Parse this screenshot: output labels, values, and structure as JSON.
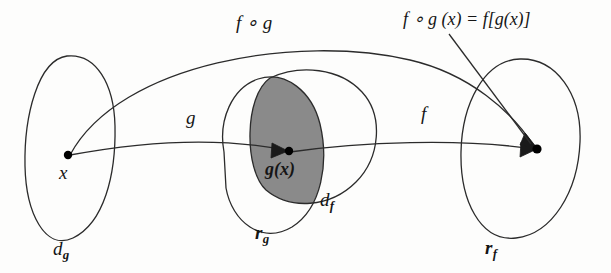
{
  "diagram": {
    "colors": {
      "background": "#fdfdfc",
      "stroke": "#2b2b2b",
      "shaded_region": "#8a8a8a",
      "point": "#000000",
      "text": "#151515"
    },
    "sets": [
      {
        "name": "domain-of-g",
        "label_main": "d",
        "label_sub": "g",
        "position": "left"
      },
      {
        "name": "range-of-g",
        "label_main": "r",
        "label_sub": "g",
        "position": "center-left"
      },
      {
        "name": "domain-of-f",
        "label_main": "d",
        "label_sub": "f",
        "position": "center-right"
      },
      {
        "name": "range-of-f",
        "label_main": "r",
        "label_sub": "f",
        "position": "right"
      }
    ],
    "points": [
      {
        "name": "x",
        "label": "x",
        "set": "domain-of-g"
      },
      {
        "name": "g-of-x",
        "label": "g(x)",
        "set": "range-of-g ∩ domain-of-f"
      },
      {
        "name": "f-of-g-of-x",
        "label": "",
        "set": "range-of-f"
      }
    ],
    "arrows": [
      {
        "name": "g-arrow",
        "label": "g",
        "from": "x",
        "to": "g(x)"
      },
      {
        "name": "f-arrow",
        "label": "f",
        "from": "g(x)",
        "to": "f[g(x)]"
      },
      {
        "name": "fog-arrow",
        "label": "f ∘ g",
        "from": "x",
        "to": "f[g(x)]"
      }
    ],
    "annotations": {
      "composition_arc_label": "f ∘ g",
      "composition_equation": "f ∘ g (x) = f[g(x)]",
      "equation_parts": {
        "f1": "f",
        "ring": "∘",
        "g1": "g",
        "arg": "(x)",
        "equals": "=",
        "f2": "f",
        "bracket_open": "[",
        "g2": "g",
        "inner_arg": "(x)",
        "bracket_close": "]"
      }
    }
  }
}
